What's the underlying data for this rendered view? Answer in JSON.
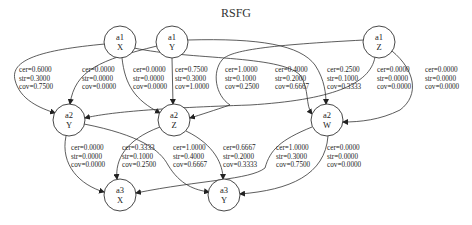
{
  "title": "RSFG",
  "nodes": [
    {
      "id": "a1X",
      "line1": "a1",
      "line2": "X",
      "cx": 120,
      "cy": 42
    },
    {
      "id": "a1Y",
      "line1": "a1",
      "line2": "Y",
      "cx": 172,
      "cy": 42
    },
    {
      "id": "a1Z",
      "line1": "a1",
      "line2": "Z",
      "cx": 379,
      "cy": 42
    },
    {
      "id": "a2Y",
      "line1": "a2",
      "line2": "Y",
      "cx": 69,
      "cy": 120
    },
    {
      "id": "a2Z",
      "line1": "a2",
      "line2": "Z",
      "cx": 174,
      "cy": 120
    },
    {
      "id": "a2W",
      "line1": "a2",
      "line2": "W",
      "cx": 327,
      "cy": 120
    },
    {
      "id": "a3X",
      "line1": "a3",
      "line2": "X",
      "cx": 120,
      "cy": 195
    },
    {
      "id": "a3Y",
      "line1": "a3",
      "line2": "Y",
      "cx": 224,
      "cy": 195
    }
  ],
  "edges": [
    {
      "from": "a1X",
      "to": "a2Y",
      "cer": "cer=0.6000",
      "str": "str=0.3000",
      "cov": "cov=0.7500"
    },
    {
      "from": "a1Y",
      "to": "a2Y",
      "cer": "cer=0.0000",
      "str": "str=0.0000",
      "cov": "cov=0.0000"
    },
    {
      "from": "a1X",
      "to": "a2Z",
      "cer": "cer=0.0000",
      "str": "str=0.0000",
      "cov": "cov=0.0000"
    },
    {
      "from": "a1Y",
      "to": "a2Z",
      "cer": "cer=0.7500",
      "str": "str=0.3000",
      "cov": "cov=1.0000"
    },
    {
      "from": "a1Z",
      "to": "a2Z",
      "cer": "cer=1.0000",
      "str": "str=0.1000",
      "cov": "cov=0.2500"
    },
    {
      "from": "a1X",
      "to": "a2W",
      "cer": "cer=0.4000",
      "str": "str=0.2000",
      "cov": "cov=0.6667"
    },
    {
      "from": "a1Y",
      "to": "a2W",
      "cer": "cer=0.2500",
      "str": "str=0.1000",
      "cov": "cov=0.3333"
    },
    {
      "from": "a1Z",
      "to": "a2Y",
      "cer": "cer=0.0000",
      "str": "str=0.0000",
      "cov": "cov=0.0000"
    },
    {
      "from": "a1Z",
      "to": "a2W",
      "cer": "cer=0.0000",
      "str": "str=0.0000",
      "cov": "cov=0.0000"
    },
    {
      "from": "a2Y",
      "to": "a3X",
      "cer": "cer=0.0000",
      "str": "str=0.0000",
      "cov": "cov=0.0000"
    },
    {
      "from": "a2Z",
      "to": "a3X",
      "cer": "cer=0.3333",
      "str": "str=0.1000",
      "cov": "cov=0.2500"
    },
    {
      "from": "a2Y",
      "to": "a3Y",
      "cer": "cer=1.0000",
      "str": "str=0.4000",
      "cov": "cov=0.6667"
    },
    {
      "from": "a2Z",
      "to": "a3Y",
      "cer": "cer=0.6667",
      "str": "str=0.2000",
      "cov": "cov=0.3333"
    },
    {
      "from": "a2W",
      "to": "a3X",
      "cer": "cer=1.0000",
      "str": "str=0.3000",
      "cov": "cov=0.7500"
    },
    {
      "from": "a2W",
      "to": "a3Y",
      "cer": "cer=0.0000",
      "str": "str=0.0000",
      "cov": "cov=0.0000"
    }
  ]
}
